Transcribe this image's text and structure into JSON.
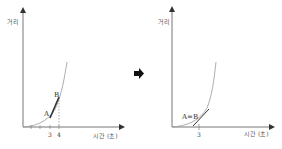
{
  "left_panel": {
    "y_axis_label": "거리",
    "x_axis_label": "시간 (초)",
    "ticks": [
      "3",
      "4"
    ],
    "point_a": "A",
    "point_b": "B"
  },
  "arrow": "➡",
  "right_panel": {
    "y_axis_label": "거리",
    "x_axis_label": "시간 (초)",
    "ticks": [
      "3"
    ],
    "point_ab": "A=B"
  },
  "colors": {
    "axis": "#555555",
    "curve": "#888888",
    "secant": "#333333"
  }
}
